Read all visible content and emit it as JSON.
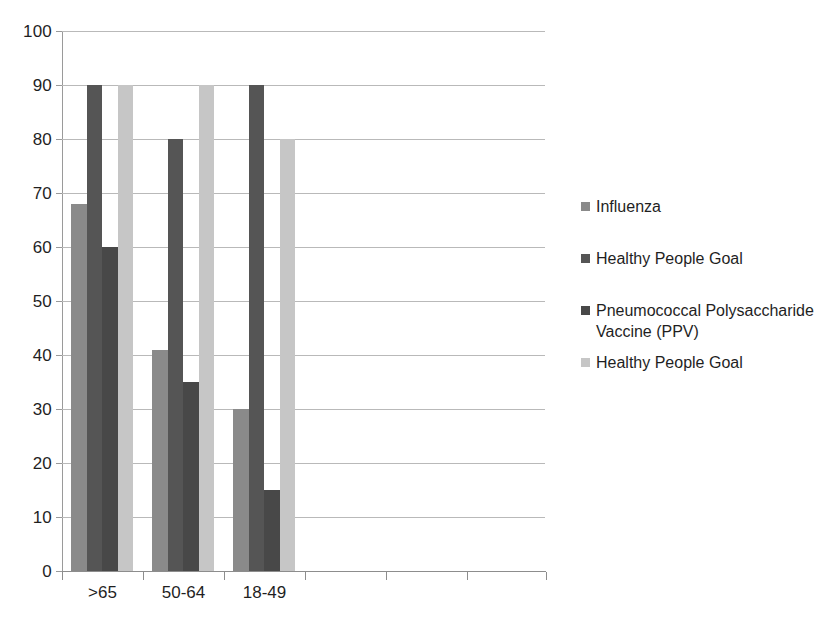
{
  "chart_data": {
    "type": "bar",
    "title": "",
    "subtitle": "",
    "xlabel": "",
    "ylabel": "",
    "categories": [
      ">65",
      "50-64",
      "18-49",
      "",
      "",
      ""
    ],
    "visible_categories": [
      ">65",
      "50-64",
      "18-49"
    ],
    "ylim": [
      0,
      100
    ],
    "ytick_labels": [
      "100",
      "90",
      "80",
      "70",
      "60",
      "50",
      "40",
      "30",
      "20",
      "10",
      "0"
    ],
    "ytick_values": [
      100,
      90,
      80,
      70,
      60,
      50,
      40,
      30,
      20,
      10,
      0
    ],
    "grid": "horizontal",
    "legend_position": "right",
    "series": [
      {
        "name": "Influenza",
        "color": "#8a8a8a",
        "values": [
          68,
          41,
          30,
          null,
          null,
          null
        ]
      },
      {
        "name": "Healthy People Goal",
        "color": "#555555",
        "values": [
          90,
          80,
          90,
          null,
          null,
          null
        ]
      },
      {
        "name": "Pneumococcal Polysaccharide Vaccine (PPV)",
        "color": "#484848",
        "values": [
          60,
          35,
          15,
          null,
          null,
          null
        ]
      },
      {
        "name": "Healthy People Goal",
        "color": "#c6c6c6",
        "values": [
          90,
          90,
          80,
          null,
          null,
          null
        ]
      }
    ]
  },
  "colors": {
    "gridline": "#b9b9b9",
    "axis": "#8d8d8d",
    "text": "#1f1f1f",
    "background": "#ffffff"
  }
}
